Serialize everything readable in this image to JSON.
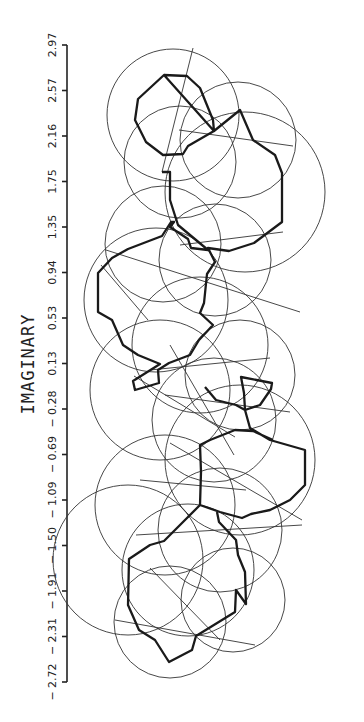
{
  "chart_data": {
    "type": "scatter",
    "title": "",
    "orientation": "rotated-90",
    "axis": {
      "label": "IMAGINARY",
      "ticks": [
        "2.97",
        "2.57",
        "2.16",
        "1.75",
        "1.35",
        "0.94",
        "0.53",
        "0.13",
        "-0.28",
        "-0.69",
        "-1.09",
        "-1.50",
        "-1.91",
        "-2.31",
        "-2.72"
      ],
      "range": [
        -2.72,
        2.97
      ],
      "grid": false
    },
    "circles": [
      {
        "cx": 173,
        "cy": 115,
        "r": 66
      },
      {
        "cx": 238,
        "cy": 140,
        "r": 58
      },
      {
        "cx": 180,
        "cy": 162,
        "r": 56
      },
      {
        "cx": 245,
        "cy": 192,
        "r": 80
      },
      {
        "cx": 163,
        "cy": 244,
        "r": 58
      },
      {
        "cx": 215,
        "cy": 260,
        "r": 56
      },
      {
        "cx": 156,
        "cy": 300,
        "r": 72
      },
      {
        "cx": 200,
        "cy": 345,
        "r": 68
      },
      {
        "cx": 160,
        "cy": 390,
        "r": 70
      },
      {
        "cx": 240,
        "cy": 375,
        "r": 55
      },
      {
        "cx": 214,
        "cy": 420,
        "r": 62
      },
      {
        "cx": 240,
        "cy": 460,
        "r": 75
      },
      {
        "cx": 165,
        "cy": 505,
        "r": 70
      },
      {
        "cx": 220,
        "cy": 530,
        "r": 62
      },
      {
        "cx": 188,
        "cy": 570,
        "r": 66
      },
      {
        "cx": 128,
        "cy": 560,
        "r": 75
      },
      {
        "cx": 233,
        "cy": 600,
        "r": 52
      },
      {
        "cx": 170,
        "cy": 622,
        "r": 56
      }
    ],
    "chords": [
      [
        [
          193,
          48
        ],
        [
          162,
          172
        ]
      ],
      [
        [
          179,
          130
        ],
        [
          293,
          146
        ]
      ],
      [
        [
          106,
          250
        ],
        [
          300,
          312
        ]
      ],
      [
        [
          101,
          265
        ],
        [
          148,
          320
        ]
      ],
      [
        [
          180,
          245
        ],
        [
          283,
          232
        ]
      ],
      [
        [
          150,
          370
        ],
        [
          270,
          358
        ]
      ],
      [
        [
          134,
          376
        ],
        [
          235,
          437
        ]
      ],
      [
        [
          165,
          395
        ],
        [
          290,
          412
        ]
      ],
      [
        [
          170,
          443
        ],
        [
          302,
          520
        ]
      ],
      [
        [
          140,
          480
        ],
        [
          246,
          490
        ]
      ],
      [
        [
          136,
          535
        ],
        [
          302,
          525
        ]
      ],
      [
        [
          150,
          568
        ],
        [
          220,
          640
        ]
      ],
      [
        [
          115,
          620
        ],
        [
          255,
          645
        ]
      ],
      [
        [
          170,
          345
        ],
        [
          234,
          455
        ]
      ]
    ],
    "boundary_path": [
      [
        164,
        75
      ],
      [
        187,
        76
      ],
      [
        200,
        88
      ],
      [
        213,
        120
      ],
      [
        214,
        131
      ],
      [
        188,
        146
      ],
      [
        183,
        154
      ],
      [
        163,
        155
      ],
      [
        146,
        142
      ],
      [
        135,
        120
      ],
      [
        138,
        99
      ],
      [
        164,
        75
      ],
      [
        214,
        131
      ],
      [
        240,
        110
      ],
      [
        253,
        140
      ],
      [
        275,
        155
      ],
      [
        282,
        173
      ],
      [
        282,
        222
      ],
      [
        254,
        243
      ],
      [
        229,
        251
      ],
      [
        208,
        248
      ],
      [
        215,
        262
      ],
      [
        207,
        274
      ],
      [
        204,
        303
      ],
      [
        200,
        313
      ],
      [
        213,
        325
      ],
      [
        199,
        340
      ],
      [
        190,
        355
      ],
      [
        169,
        363
      ],
      [
        158,
        370
      ],
      [
        159,
        383
      ],
      [
        135,
        390
      ],
      [
        133,
        381
      ],
      [
        160,
        364
      ],
      [
        138,
        355
      ],
      [
        123,
        345
      ],
      [
        112,
        320
      ],
      [
        98,
        312
      ],
      [
        98,
        273
      ],
      [
        112,
        258
      ],
      [
        128,
        249
      ],
      [
        162,
        236
      ],
      [
        171,
        222
      ],
      [
        174,
        222
      ],
      [
        170,
        227
      ],
      [
        188,
        239
      ],
      [
        191,
        248
      ],
      [
        208,
        250
      ],
      [
        178,
        225
      ],
      [
        170,
        200
      ],
      [
        170,
        172
      ],
      [
        162,
        172
      ]
    ],
    "boundary_path_lower": [
      [
        205,
        387
      ],
      [
        216,
        400
      ],
      [
        236,
        405
      ],
      [
        245,
        410
      ],
      [
        260,
        405
      ],
      [
        271,
        389
      ],
      [
        272,
        383
      ],
      [
        241,
        377
      ],
      [
        244,
        393
      ],
      [
        245,
        410
      ],
      [
        250,
        428
      ],
      [
        270,
        440
      ],
      [
        305,
        450
      ],
      [
        305,
        485
      ],
      [
        290,
        500
      ],
      [
        270,
        510
      ],
      [
        251,
        514
      ],
      [
        242,
        518
      ],
      [
        220,
        512
      ],
      [
        200,
        505
      ],
      [
        201,
        472
      ],
      [
        200,
        445
      ],
      [
        210,
        440
      ],
      [
        235,
        430
      ],
      [
        253,
        431
      ],
      [
        273,
        440
      ]
    ],
    "boundary_path_bottom": [
      [
        200,
        505
      ],
      [
        183,
        522
      ],
      [
        164,
        541
      ],
      [
        150,
        545
      ],
      [
        129,
        559
      ],
      [
        128,
        605
      ],
      [
        139,
        630
      ],
      [
        155,
        640
      ],
      [
        169,
        662
      ],
      [
        192,
        650
      ],
      [
        196,
        636
      ],
      [
        235,
        612
      ],
      [
        236,
        590
      ],
      [
        246,
        604
      ],
      [
        245,
        572
      ],
      [
        238,
        555
      ],
      [
        236,
        540
      ],
      [
        219,
        522
      ],
      [
        217,
        512
      ]
    ]
  }
}
